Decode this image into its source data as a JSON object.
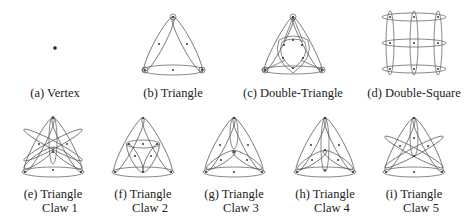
{
  "panels": [
    {
      "id": "a",
      "caption": "(a) Vertex",
      "cx": 55,
      "label_y": 86
    },
    {
      "id": "b",
      "caption": "(b) Triangle",
      "cx": 173,
      "label_y": 86
    },
    {
      "id": "c",
      "caption": "(c) Double-Triangle",
      "cx": 293,
      "label_y": 86
    },
    {
      "id": "d",
      "caption": "(d) Double-Square",
      "cx": 414,
      "label_y": 86
    },
    {
      "id": "e",
      "caption_line1": "(e) Triangle",
      "caption_line2": "Claw 1",
      "cx": 53,
      "label_y": 187
    },
    {
      "id": "f",
      "caption_line1": "(f) Triangle",
      "caption_line2": "Claw 2",
      "cx": 143,
      "label_y": 187
    },
    {
      "id": "g",
      "caption_line1": "(g) Triangle",
      "caption_line2": "Claw 3",
      "cx": 234,
      "label_y": 187
    },
    {
      "id": "h",
      "caption_line1": "(h) Triangle",
      "caption_line2": "Claw 4",
      "cx": 325,
      "label_y": 187
    },
    {
      "id": "i",
      "caption_line1": "(i) Triangle",
      "caption_line2": "Claw 5",
      "cx": 414,
      "label_y": 187
    }
  ],
  "colors": {
    "stroke": "#444444",
    "dot": "#222222"
  }
}
